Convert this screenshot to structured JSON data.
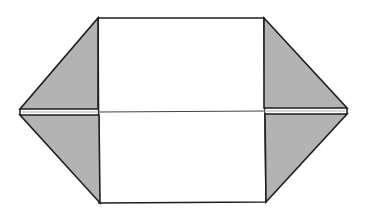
{
  "diagram": {
    "canvas": {
      "width": 367,
      "height": 215
    },
    "colors": {
      "background": "#ffffff",
      "stroke": "#1e1e1e",
      "flap_fill": "#b3b3b3",
      "paper_fill": "#ffffff"
    },
    "shapes": {
      "center_rectangle": {
        "x1": 98,
        "y1": 18,
        "x2": 265,
        "y2": 203
      },
      "center_crease_y": 112,
      "left_tip": {
        "x": 20,
        "y": 112
      },
      "right_tip": {
        "x": 347,
        "y": 112
      },
      "flaps": [
        {
          "name": "top-left-flap",
          "points": "98,18 98,109 21,109"
        },
        {
          "name": "bottom-left-flap",
          "points": "99,115 99,203 21,115"
        },
        {
          "name": "top-right-flap",
          "points": "264,18 264,109 346,109"
        },
        {
          "name": "bottom-right-flap",
          "points": "265,115 265,202 346,115"
        }
      ]
    }
  }
}
